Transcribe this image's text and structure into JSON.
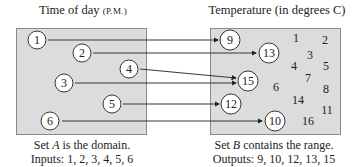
{
  "domain_set": {
    "title": "Time of day",
    "title_suffix": "(P.M.)",
    "elements": [
      "1",
      "2",
      "3",
      "4",
      "5",
      "6"
    ],
    "caption_line1_pre": "Set ",
    "caption_line1_var": "A",
    "caption_line1_post": " is the domain.",
    "caption_line2": "Inputs: 1, 2, 3, 4, 5, 6"
  },
  "range_set": {
    "title": "Temperature (in degrees C)",
    "circled_elements": [
      "9",
      "13",
      "15",
      "12",
      "10"
    ],
    "other_elements": [
      "1",
      "2",
      "3",
      "4",
      "5",
      "6",
      "7",
      "8",
      "14",
      "11",
      "16"
    ],
    "caption_line1_pre": "Set ",
    "caption_line1_var": "B",
    "caption_line1_post": " contains the range.",
    "caption_line2": "Outputs: 9, 10, 12, 13, 15"
  },
  "mappings": [
    {
      "from": "1",
      "to": "9"
    },
    {
      "from": "2",
      "to": "13"
    },
    {
      "from": "3",
      "to": "15"
    },
    {
      "from": "4",
      "to": "15"
    },
    {
      "from": "5",
      "to": "12"
    },
    {
      "from": "6",
      "to": "10"
    }
  ],
  "colors": {
    "box_fill": "#dcdcdc",
    "box_border": "#8a8a8a",
    "line": "#222222"
  }
}
